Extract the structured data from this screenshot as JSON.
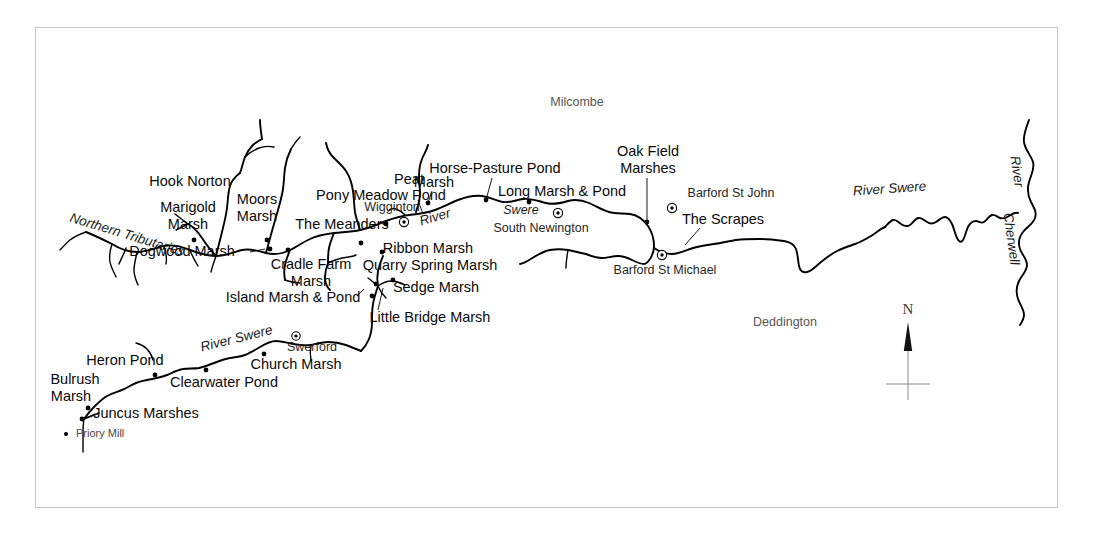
{
  "map": {
    "title": "River Swere catchment marshes map",
    "frame": {
      "x": 35,
      "y": 27,
      "width": 1023,
      "height": 481,
      "color": "#c9c9c9"
    },
    "background": "#ffffff",
    "ink": "#000000"
  },
  "compass": {
    "name": "north-arrow",
    "label": "N"
  },
  "river_labels": [
    {
      "id": "northern-tributaries",
      "text": "Northern Tributaries",
      "x": 70,
      "y": 218,
      "rotate": 17,
      "style": "italic"
    },
    {
      "id": "river-swere-middle-river",
      "text": "River",
      "x": 420,
      "y": 222,
      "rotate": -16,
      "style": "italic"
    },
    {
      "id": "river-swere-middle-swere",
      "text": "Swere",
      "x": 521,
      "y": 211,
      "rotate": 0,
      "style": "italic"
    },
    {
      "id": "river-swere-south",
      "text": "River Swere",
      "x": 231,
      "y": 344,
      "rotate": -14,
      "style": "italic"
    },
    {
      "id": "river-swere-east",
      "text": "River Swere",
      "x": 893,
      "y": 192,
      "rotate": -4,
      "style": "italic"
    },
    {
      "id": "river-cherwell-upper",
      "text": "River",
      "x": 1018,
      "y": 175,
      "rotate": 82,
      "style": "italic"
    },
    {
      "id": "river-cherwell-lower",
      "text": "Cherwell",
      "x": 1009,
      "y": 240,
      "rotate": 82,
      "style": "italic"
    }
  ],
  "marsh_labels": [
    {
      "id": "hook-norton",
      "text": "Hook Norton",
      "x": 190,
      "y": 182,
      "anchor": "middle",
      "kind": "area"
    },
    {
      "id": "marigold-marsh-1",
      "text": "Marigold",
      "x": 188,
      "y": 208,
      "anchor": "middle",
      "kind": "marsh"
    },
    {
      "id": "marigold-marsh-2",
      "text": "Marsh",
      "x": 188,
      "y": 225,
      "anchor": "middle",
      "kind": "marsh"
    },
    {
      "id": "moors-marsh-1",
      "text": "Moors",
      "x": 257,
      "y": 200,
      "anchor": "middle",
      "kind": "marsh"
    },
    {
      "id": "moors-marsh-2",
      "text": "Marsh",
      "x": 257,
      "y": 217,
      "anchor": "middle",
      "kind": "marsh"
    },
    {
      "id": "dogwood-marsh",
      "text": "Dogwood Marsh",
      "x": 182,
      "y": 252,
      "anchor": "middle",
      "kind": "marsh"
    },
    {
      "id": "the-meanders",
      "text": "The Meanders",
      "x": 342,
      "y": 225,
      "anchor": "middle",
      "kind": "marsh"
    },
    {
      "id": "pony-meadow-pond",
      "text": "Pony Meadow Pond",
      "x": 381,
      "y": 196,
      "anchor": "middle",
      "kind": "pond"
    },
    {
      "id": "peat-marsh-1",
      "text": "Peat",
      "x": 409,
      "y": 180,
      "anchor": "middle",
      "kind": "marsh"
    },
    {
      "id": "peat-marsh-2",
      "text": "Marsh",
      "x": 432,
      "y": 182,
      "anchor": "middle",
      "kind": "marsh"
    },
    {
      "id": "horse-pasture-pond",
      "text": "Horse-Pasture Pond",
      "x": 495,
      "y": 169,
      "anchor": "middle",
      "kind": "pond"
    },
    {
      "id": "long-marsh-and-pond",
      "text": "Long Marsh & Pond",
      "x": 562,
      "y": 192,
      "anchor": "middle",
      "kind": "pond"
    },
    {
      "id": "oak-field-marshes-1",
      "text": "Oak Field",
      "x": 648,
      "y": 152,
      "anchor": "middle",
      "kind": "marsh"
    },
    {
      "id": "oak-field-marshes-2",
      "text": "Marshes",
      "x": 648,
      "y": 169,
      "anchor": "middle",
      "kind": "marsh"
    },
    {
      "id": "the-scrapes",
      "text": "The Scrapes",
      "x": 723,
      "y": 220,
      "anchor": "middle",
      "kind": "marsh"
    },
    {
      "id": "ribbon-marsh",
      "text": "Ribbon Marsh",
      "x": 428,
      "y": 249,
      "anchor": "middle",
      "kind": "marsh"
    },
    {
      "id": "quarry-spring-marsh",
      "text": "Quarry Spring Marsh",
      "x": 430,
      "y": 266,
      "anchor": "middle",
      "kind": "marsh"
    },
    {
      "id": "cradle-farm-marsh-1",
      "text": "Cradle Farm",
      "x": 311,
      "y": 265,
      "anchor": "middle",
      "kind": "marsh"
    },
    {
      "id": "cradle-farm-marsh-2",
      "text": "Marsh",
      "x": 311,
      "y": 282,
      "anchor": "middle",
      "kind": "marsh"
    },
    {
      "id": "island-marsh-and-pond",
      "text": "Island Marsh & Pond",
      "x": 293,
      "y": 298,
      "anchor": "middle",
      "kind": "pond"
    },
    {
      "id": "sedge-marsh",
      "text": "Sedge Marsh",
      "x": 436,
      "y": 288,
      "anchor": "middle",
      "kind": "marsh"
    },
    {
      "id": "little-bridge-marsh",
      "text": "Little Bridge Marsh",
      "x": 430,
      "y": 318,
      "anchor": "middle",
      "kind": "marsh"
    },
    {
      "id": "heron-pond",
      "text": "Heron Pond",
      "x": 125,
      "y": 361,
      "anchor": "middle",
      "kind": "pond"
    },
    {
      "id": "clearwater-pond",
      "text": "Clearwater Pond",
      "x": 224,
      "y": 383,
      "anchor": "middle",
      "kind": "pond"
    },
    {
      "id": "church-marsh",
      "text": "Church Marsh",
      "x": 296,
      "y": 365,
      "anchor": "middle",
      "kind": "marsh"
    },
    {
      "id": "bulrush-marsh-1",
      "text": "Bulrush",
      "x": 75,
      "y": 380,
      "anchor": "middle",
      "kind": "marsh"
    },
    {
      "id": "bulrush-marsh-2",
      "text": "Marsh",
      "x": 71,
      "y": 397,
      "anchor": "middle",
      "kind": "marsh"
    },
    {
      "id": "juncus-marshes",
      "text": "Juncus Marshes",
      "x": 146,
      "y": 414,
      "anchor": "middle",
      "kind": "marsh"
    }
  ],
  "settlement_labels": [
    {
      "id": "wigginton",
      "text": "Wigginton",
      "x": 392,
      "y": 208,
      "marker_x": 404,
      "marker_y": 222
    },
    {
      "id": "south-newington",
      "text": "South Newington",
      "x": 541,
      "y": 229,
      "marker_x": 558,
      "marker_y": 213
    },
    {
      "id": "swerford",
      "text": "Swerford",
      "x": 312,
      "y": 348,
      "marker_x": 296,
      "marker_y": 336
    },
    {
      "id": "barford-st-john",
      "text": "Barford St John",
      "x": 731,
      "y": 194,
      "marker_x": 672,
      "marker_y": 208
    },
    {
      "id": "barford-st-michael",
      "text": "Barford St Michael",
      "x": 665,
      "y": 271,
      "marker_x": 662,
      "marker_y": 255
    }
  ],
  "place_labels": [
    {
      "id": "milcombe",
      "text": "Milcombe",
      "x": 577,
      "y": 103
    },
    {
      "id": "deddington",
      "text": "Deddington",
      "x": 785,
      "y": 323
    }
  ],
  "small_labels": [
    {
      "id": "priory-mill",
      "text": "Priory Mill",
      "x": 76,
      "y": 434
    }
  ]
}
